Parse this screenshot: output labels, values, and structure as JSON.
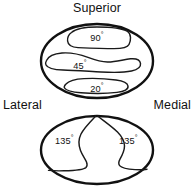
{
  "figure": {
    "background_color": "#ffffff",
    "line_color": "#111111",
    "text_color": "#111111"
  },
  "orientation_labels": {
    "superior": "Superior",
    "lateral": "Lateral",
    "medial": "Medial"
  },
  "diagrams": [
    {
      "name": "upper-ellipse",
      "position": "top",
      "shape": "ellipse",
      "zones": [
        {
          "name": "zone-90",
          "value": "90",
          "unit": "°",
          "label": "90°",
          "position": "superior"
        },
        {
          "name": "zone-45",
          "value": "45",
          "unit": "°",
          "label": "45°",
          "position": "middle"
        },
        {
          "name": "zone-20",
          "value": "20",
          "unit": "°",
          "label": "20°",
          "position": "inferior"
        }
      ]
    },
    {
      "name": "lower-ellipse",
      "position": "bottom",
      "shape": "ellipse",
      "zones": [
        {
          "name": "zone-135-lateral",
          "value": "135",
          "unit": "°",
          "label": "135°",
          "position": "lateral"
        },
        {
          "name": "zone-135-medial",
          "value": "135",
          "unit": "°",
          "label": "135°",
          "position": "medial"
        }
      ]
    }
  ],
  "angles": {
    "a90": "90",
    "a45": "45",
    "a20": "20",
    "a135_lateral": "135",
    "a135_medial": "135",
    "degree_symbol": "°"
  }
}
